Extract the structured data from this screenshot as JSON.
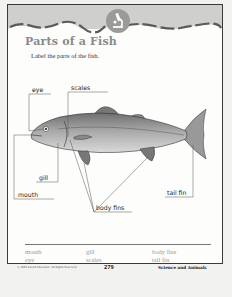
{
  "worksheet": {
    "title": "Parts of a Fish",
    "instruction": "Label the parts of the fish.",
    "banner_icon": "microscope-icon",
    "colors": {
      "banner_band": "#c8c8c6",
      "banner_wave": "#5a5a5a",
      "icon_circle": "#9a9a98",
      "title": "#8a8a8a",
      "wordbank_text": "#999999"
    }
  },
  "diagram": {
    "subject": "fish",
    "labels": [
      {
        "id": "eye",
        "text": "eye"
      },
      {
        "id": "scales",
        "text": "scales"
      },
      {
        "id": "gill",
        "text": "gill"
      },
      {
        "id": "mouth",
        "text": "mouth"
      },
      {
        "id": "tail_fin",
        "text": "tail fin"
      },
      {
        "id": "body_fins",
        "text": "body fins"
      }
    ]
  },
  "word_bank": {
    "columns": [
      [
        "mouth",
        "eye"
      ],
      [
        "gill",
        "scales"
      ],
      [
        "body fins",
        "tail fin"
      ]
    ]
  },
  "footer": {
    "copyright": "© 2003 Sound Education. All Rights Reserved.",
    "page_number": "279",
    "section": "Science and Animals"
  }
}
